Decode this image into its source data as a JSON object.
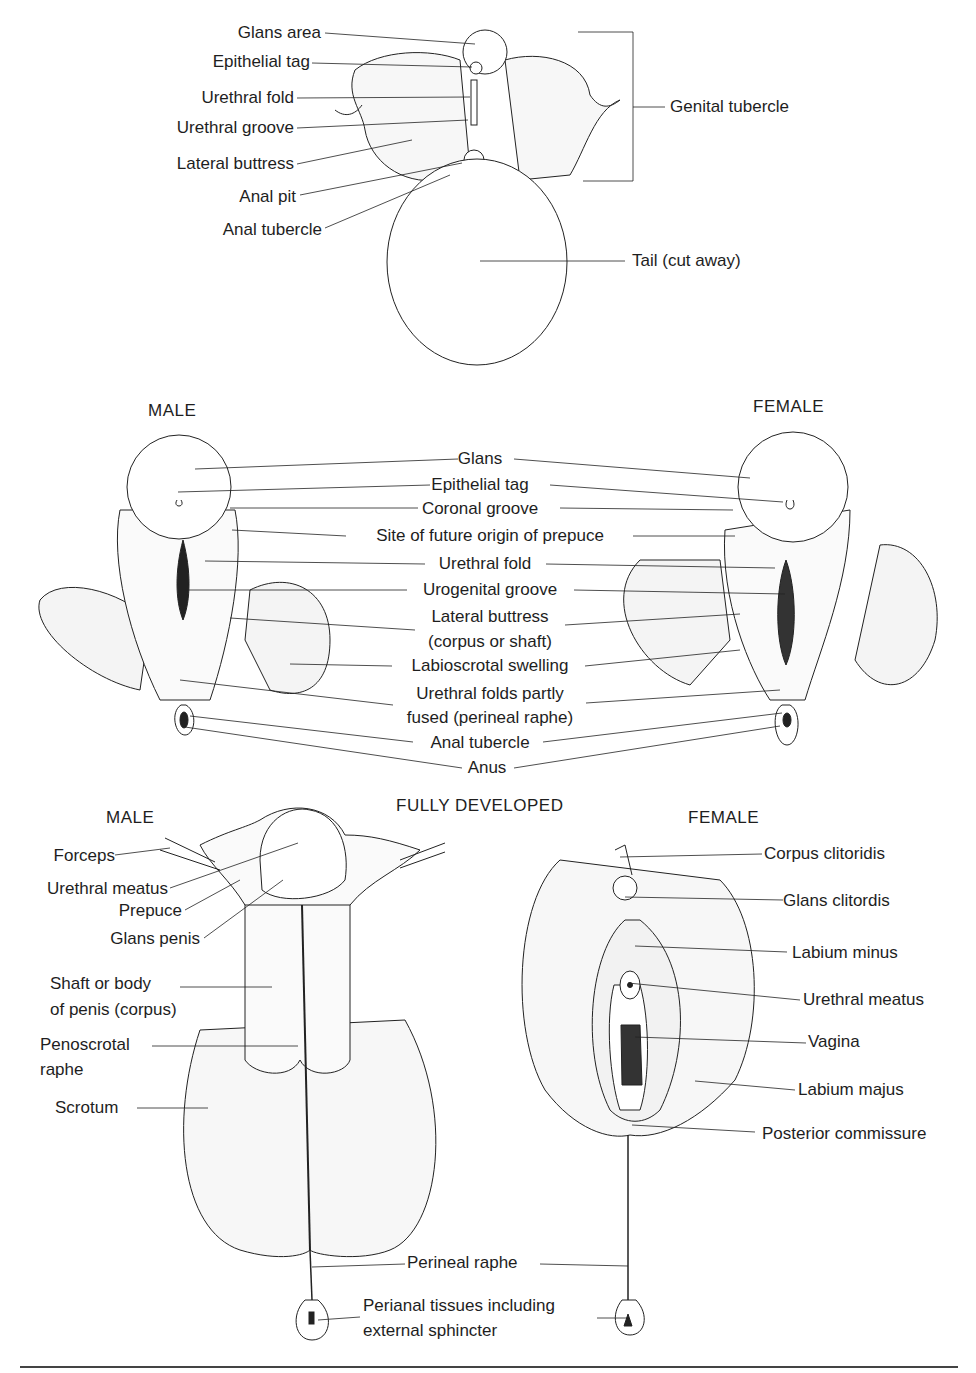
{
  "panel_top": {
    "labels_left": [
      "Glans area",
      "Epithelial tag",
      "Urethral fold",
      "Urethral groove",
      "Lateral buttress",
      "Anal pit",
      "Anal tubercle"
    ],
    "labels_right": [
      "Genital tubercle",
      "Tail (cut away)"
    ]
  },
  "panel_middle": {
    "male_heading": "MALE",
    "female_heading": "FEMALE",
    "center_labels": [
      "Glans",
      "Epithelial tag",
      "Coronal groove",
      "Site of future origin of prepuce",
      "Urethral fold",
      "Urogenital groove",
      "Lateral buttress",
      "(corpus or shaft)",
      "Labioscrotal swelling",
      "Urethral folds partly",
      "fused (perineal raphe)",
      "Anal tubercle",
      "Anus"
    ]
  },
  "panel_bottom": {
    "title": "FULLY DEVELOPED",
    "male_heading": "MALE",
    "female_heading": "FEMALE",
    "male_labels": [
      "Forceps",
      "Urethral meatus",
      "Prepuce",
      "Glans penis",
      "Shaft or body",
      "of penis (corpus)",
      "Penoscrotal",
      "raphe",
      "Scrotum"
    ],
    "female_labels": [
      "Corpus clitoridis",
      "Glans clitordis",
      "Labium minus",
      "Urethral meatus",
      "Vagina",
      "Labium majus",
      "Posterior commissure"
    ],
    "shared_labels": [
      "Perineal raphe",
      "Perianal tissues including",
      "external sphincter"
    ]
  }
}
